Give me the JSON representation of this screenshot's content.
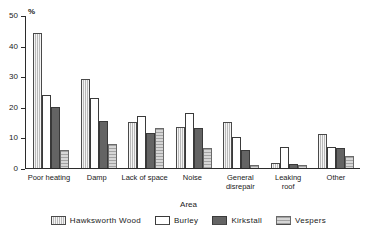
{
  "chart_data": {
    "type": "bar",
    "title": "",
    "subtitle": "",
    "unit_label": "%",
    "xlabel": "Area",
    "ylabel": "",
    "ylim": [
      0,
      50
    ],
    "ytick_labels": [
      "0",
      "10",
      "20",
      "30",
      "40",
      "50"
    ],
    "ytick_values": [
      0,
      10,
      20,
      30,
      40,
      50
    ],
    "grid": false,
    "legend_position": "bottom",
    "categories": [
      "Poor heating",
      "Damp",
      "Lack of space",
      "Noise",
      "General\ndisrepair",
      "Leaking\nroof",
      "Other"
    ],
    "series": [
      {
        "name": "Hawksworth Wood",
        "values": [
          44,
          29,
          15,
          13.5,
          15,
          1.5,
          11
        ]
      },
      {
        "name": "Burley",
        "values": [
          24,
          23,
          17,
          18,
          10,
          7,
          7
        ]
      },
      {
        "name": "Kirkstall",
        "values": [
          20,
          15.5,
          11.5,
          13,
          6,
          1.3,
          6.5
        ]
      },
      {
        "name": "Vespers",
        "values": [
          6,
          8,
          13,
          6.5,
          1,
          1,
          4
        ]
      }
    ],
    "colors": {
      "hawksworth_wood": "#b9b9b9",
      "burley": "#ffffff",
      "kirkstall": "#646464",
      "vespers": "#d6d6d6",
      "axis": "#2b2b2b",
      "text": "#1a1a1a",
      "background": "#ffffff"
    }
  }
}
